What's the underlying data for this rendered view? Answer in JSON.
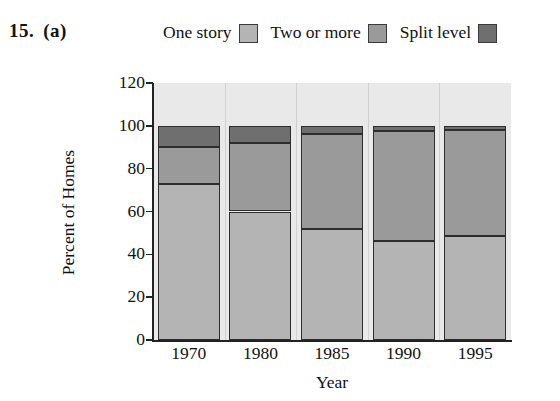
{
  "problem": {
    "number": "15.",
    "part": "(a)"
  },
  "scan_artifact_text": "",
  "legend": {
    "position": "top",
    "items": [
      {
        "label": "One story",
        "color": "#b4b4b4",
        "swatch_name": "legend-swatch-one-story"
      },
      {
        "label": "Two or more",
        "color": "#9a9a9a",
        "swatch_name": "legend-swatch-two-or-more"
      },
      {
        "label": "Split level",
        "color": "#6f6f6f",
        "swatch_name": "legend-swatch-split-level"
      }
    ]
  },
  "chart_data": {
    "type": "bar",
    "stacked": true,
    "title": "",
    "xlabel": "Year",
    "ylabel": "Percent of Homes",
    "categories": [
      "1970",
      "1980",
      "1985",
      "1990",
      "1995"
    ],
    "ylim": [
      0,
      120
    ],
    "yticks": [
      "0",
      "20",
      "40",
      "60",
      "80",
      "100",
      "120"
    ],
    "ytick_values": [
      0,
      20,
      40,
      60,
      80,
      100,
      120
    ],
    "grid": false,
    "plot_background": "#e9e9e9",
    "series": [
      {
        "name": "One story",
        "color": "#b4b4b4",
        "values": [
          73,
          60,
          52,
          46,
          48.5
        ]
      },
      {
        "name": "Two or more",
        "color": "#9a9a9a",
        "values": [
          17,
          32,
          44,
          51.5,
          49.5
        ]
      },
      {
        "name": "Split level",
        "color": "#6f6f6f",
        "values": [
          10,
          8,
          4,
          2.5,
          2
        ]
      }
    ],
    "cumulative_tops": {
      "One story": [
        73,
        60,
        52,
        46,
        48.5
      ],
      "Two or more": [
        90,
        92,
        96,
        97.5,
        98
      ],
      "Split level": [
        100,
        100,
        100,
        100,
        100
      ]
    }
  }
}
